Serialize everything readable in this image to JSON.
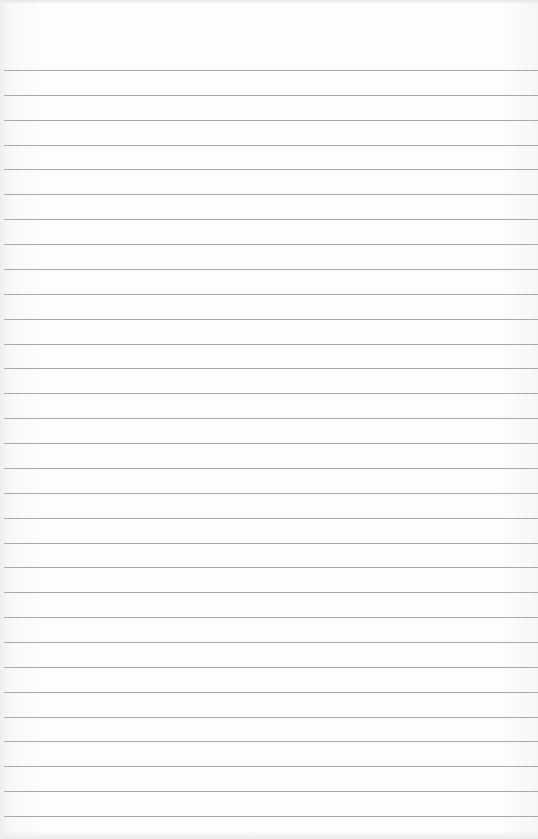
{
  "image": {
    "description": "Blank lined notebook paper",
    "background_color": "#fcfcfc",
    "line_color": "#9a9a9a",
    "line_count": 31,
    "first_line_y": 70,
    "line_spacing": 24.87
  }
}
